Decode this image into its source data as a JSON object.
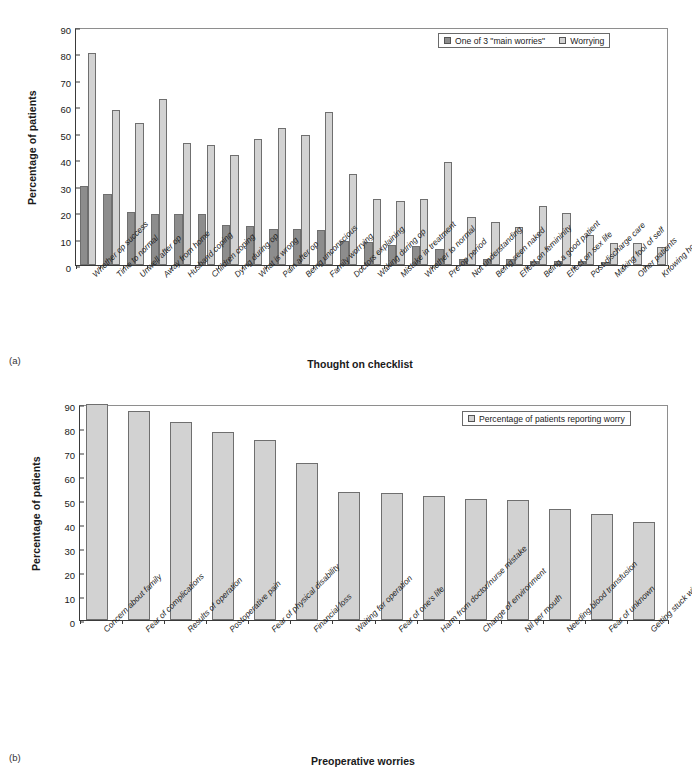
{
  "panel_a": {
    "tag": "(a)",
    "ylabel": "Percentage of patients",
    "xtitle": "Thought on checklist",
    "legend": [
      {
        "label": "One of 3 \"main worries\"",
        "key": "dark"
      },
      {
        "label": "Worrying",
        "key": "light"
      }
    ],
    "colors": {
      "dark": "#8d8d8d",
      "light": "#d2d2d2"
    }
  },
  "panel_b": {
    "tag": "(b)",
    "ylabel": "Percentage of patients",
    "xtitle": "Preoperative worries",
    "legend": [
      {
        "label": "Percentage of patients reporting worry",
        "key": "light"
      }
    ],
    "colors": {
      "light": "#d2d2d2"
    }
  },
  "chart_data": [
    {
      "type": "bar",
      "title": "",
      "xlabel": "Thought on checklist",
      "ylabel": "Percentage of patients",
      "ylim": [
        0,
        90
      ],
      "yticks": [
        0,
        10,
        20,
        30,
        40,
        50,
        60,
        70,
        80,
        90
      ],
      "grid": false,
      "legend_position": "top-right",
      "categories": [
        "Whether op success",
        "Time to normal",
        "Unwell after op",
        "Away from home",
        "Husband coping",
        "Children coping",
        "Dying during op",
        "What is wrong",
        "Pain after op",
        "Being unconscious",
        "Family worrying",
        "Doctors explaining",
        "Waking during op",
        "Mistake in treatment",
        "Whether to normal",
        "Pre-op period",
        "Not understanding",
        "Being seen naked",
        "Effect on femininity",
        "Being a good patient",
        "Effect on sex life",
        "Post-discharge care",
        "Making fool of self",
        "Other patients",
        "Knowing how to behave"
      ],
      "series": [
        {
          "name": "One of 3 \"main worries\"",
          "color": "#8d8d8d",
          "values": [
            29.8,
            26.8,
            20.0,
            19.3,
            19.3,
            19.3,
            15.3,
            14.7,
            13.7,
            13.7,
            13.1,
            9.1,
            8.6,
            7.4,
            7.1,
            6.1,
            2.4,
            2.4,
            2.4,
            1.6,
            1.6,
            1.6,
            1.0,
            0,
            0
          ]
        },
        {
          "name": "Worrying",
          "color": "#d2d2d2",
          "values": [
            80.2,
            58.5,
            53.6,
            62.8,
            46.0,
            45.2,
            41.5,
            47.5,
            51.9,
            49.1,
            57.7,
            34.6,
            25.0,
            24.1,
            25.0,
            39.0,
            18.0,
            16.4,
            14.3,
            22.3,
            19.5,
            11.3,
            8.2,
            8.2,
            6.8
          ]
        }
      ]
    },
    {
      "type": "bar",
      "title": "",
      "xlabel": "Preoperative worries",
      "ylabel": "Percentage of patients",
      "ylim": [
        0,
        90
      ],
      "yticks": [
        0,
        10,
        20,
        30,
        40,
        50,
        60,
        70,
        80,
        90
      ],
      "grid": false,
      "legend_position": "top-right",
      "categories": [
        "Concern about family",
        "Fear of complications",
        "Results of operation",
        "Postoperative pain",
        "Fear of physical disability",
        "Financial loss",
        "Waiting for operation",
        "Fear of one's life",
        "Harm from doctor/nurse mistake",
        "Change of environment",
        "Nil per mouth",
        "Needing blood transfusion",
        "Fear of unknown",
        "Getting stuck with needle"
      ],
      "series": [
        {
          "name": "Percentage of patients reporting worry",
          "color": "#d2d2d2",
          "values": [
            89.8,
            86.9,
            82.4,
            78.5,
            74.8,
            65.6,
            53.5,
            53.0,
            51.5,
            50.4,
            50.0,
            46.2,
            44.2,
            40.8
          ]
        }
      ]
    }
  ]
}
